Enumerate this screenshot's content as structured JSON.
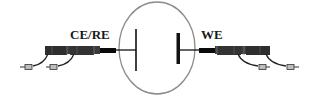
{
  "diagram": {
    "type": "electrochemical-cell-schematic",
    "labels": {
      "left_electrode": "CE/RE",
      "right_electrode": "WE"
    },
    "cell": {
      "shape": "ellipse",
      "outline_color": "#8c8c8c"
    },
    "electrodes": [
      {
        "side": "left",
        "label": "CE/RE",
        "plate": "thin vertical line"
      },
      {
        "side": "right",
        "label": "WE",
        "plate": "thick vertical bar"
      }
    ],
    "connectors": [
      {
        "side": "left",
        "cables": 2,
        "color": "#2b2b2b"
      },
      {
        "side": "right",
        "cables": 2,
        "color": "#2b2b2b"
      }
    ],
    "colors": {
      "background": "#ffffff",
      "line": "#111111",
      "connector_body": "#3a3a3a",
      "plug": "#0a0a0a",
      "tip": "#bdbdbd"
    }
  }
}
